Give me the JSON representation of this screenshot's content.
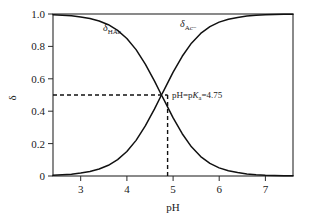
{
  "chart_data": {
    "type": "line",
    "title": "",
    "xlabel": "pH",
    "ylabel": "δ",
    "xlim": [
      2.4,
      7.6
    ],
    "ylim": [
      0,
      1.0
    ],
    "grid": false,
    "legend_position": "inline-curve-labels",
    "xticks": [
      3,
      4,
      5,
      6,
      7
    ],
    "xtick_labels": [
      "3",
      "4",
      "5",
      "6",
      "7"
    ],
    "yticks": [
      0,
      0.2,
      0.4,
      0.6,
      0.8,
      1.0
    ],
    "ytick_labels": [
      "0",
      "0.2",
      "0.4",
      "0.6",
      "0.8",
      "1.0"
    ],
    "pKa": 4.75,
    "x": [
      2.4,
      2.6,
      2.8,
      3.0,
      3.2,
      3.4,
      3.6,
      3.8,
      4.0,
      4.2,
      4.4,
      4.6,
      4.75,
      4.8,
      5.0,
      5.2,
      5.4,
      5.6,
      5.8,
      6.0,
      6.2,
      6.4,
      6.6,
      6.8,
      7.0,
      7.2,
      7.4,
      7.6
    ],
    "series": [
      {
        "name": "δHAc",
        "label": "δ",
        "subscript": "HAc",
        "values": [
          0.996,
          0.993,
          0.989,
          0.982,
          0.972,
          0.957,
          0.934,
          0.899,
          0.849,
          0.78,
          0.691,
          0.586,
          0.5,
          0.473,
          0.36,
          0.261,
          0.18,
          0.12,
          0.078,
          0.05,
          0.032,
          0.021,
          0.013,
          0.008,
          0.005,
          0.0035,
          0.0022,
          0.0014
        ]
      },
      {
        "name": "δAc−",
        "label": "δ",
        "subscript": "Ac−",
        "values": [
          0.004,
          0.007,
          0.011,
          0.018,
          0.028,
          0.043,
          0.066,
          0.101,
          0.151,
          0.22,
          0.309,
          0.414,
          0.5,
          0.527,
          0.64,
          0.739,
          0.82,
          0.88,
          0.922,
          0.95,
          0.968,
          0.979,
          0.987,
          0.992,
          0.995,
          0.9965,
          0.9978,
          0.9986
        ]
      }
    ],
    "annotations": [
      {
        "name": "crossing-point-annotation",
        "text_parts": {
          "prefix": "pH=p",
          "italic": "K",
          "subscript": "a",
          "suffix": "=4.75"
        },
        "full_text": "pH=pKa=4.75",
        "x": 4.75,
        "y": 0.5
      }
    ],
    "guides": [
      {
        "name": "horizontal-guide",
        "orientation": "horizontal",
        "value": 0.5,
        "style": "dashed"
      },
      {
        "name": "vertical-guide",
        "orientation": "vertical",
        "value": 4.75,
        "style": "dashed"
      }
    ],
    "colors": {
      "curve": "#111111",
      "axis": "#2b2b2b",
      "background": "#ffffff"
    }
  },
  "labels": {
    "x_axis_title": "pH",
    "y_axis_title": "δ",
    "curve_hac_base": "δ",
    "curve_hac_sub": "HAc",
    "curve_ac_base": "δ",
    "curve_ac_sub": "Ac−",
    "annotation_prefix": "pH=p",
    "annotation_italic": "K",
    "annotation_sub": "a",
    "annotation_suffix": "=4.75"
  },
  "ticks": {
    "x": [
      "3",
      "4",
      "5",
      "6",
      "7"
    ],
    "y": [
      "1.0",
      "0.8",
      "0.6",
      "0.4",
      "0.2",
      "0"
    ]
  }
}
